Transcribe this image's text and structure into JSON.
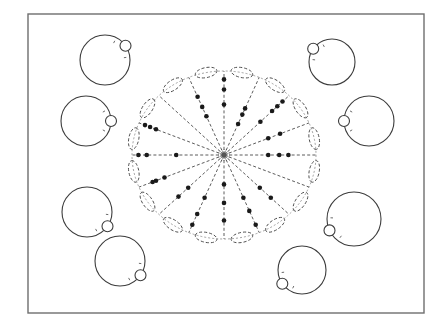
{
  "diagram": {
    "frame": {
      "x": 28,
      "y": 14,
      "width": 396,
      "height": 299
    },
    "center": {
      "x": 224,
      "y": 155
    },
    "ring": {
      "rx": 92,
      "ry": 84
    },
    "spoke_count": 16,
    "colors": {
      "line": "#3c3c3c",
      "dot": "#1a1a1a",
      "frame": "#6e6e6e",
      "background": "#ffffff"
    },
    "satellites": [
      {
        "id": "top-left-1",
        "cx": 105,
        "cy": 60,
        "r": 25,
        "knob_angle_deg": 35
      },
      {
        "id": "top-left-2",
        "cx": 86,
        "cy": 121,
        "r": 25,
        "knob_angle_deg": 0
      },
      {
        "id": "bottom-left-1",
        "cx": 87,
        "cy": 212,
        "r": 25,
        "knob_angle_deg": -35
      },
      {
        "id": "bottom-left-2",
        "cx": 120,
        "cy": 261,
        "r": 25,
        "knob_angle_deg": -35
      },
      {
        "id": "top-right-1",
        "cx": 332,
        "cy": 62,
        "r": 23,
        "knob_angle_deg": 145
      },
      {
        "id": "top-right-2",
        "cx": 369,
        "cy": 121,
        "r": 25,
        "knob_angle_deg": 180
      },
      {
        "id": "bottom-right-1",
        "cx": 354,
        "cy": 219,
        "r": 27,
        "knob_angle_deg": 205
      },
      {
        "id": "bottom-right-2",
        "cx": 302,
        "cy": 270,
        "r": 24,
        "knob_angle_deg": 215
      }
    ],
    "spoke_dots": [
      {
        "angle_deg": 0,
        "fractions": [
          0.48,
          0.6,
          0.7
        ]
      },
      {
        "angle_deg": 22.5,
        "fractions": [
          0.52,
          0.66
        ]
      },
      {
        "angle_deg": 45,
        "fractions": [
          0.56,
          0.74,
          0.82,
          0.9
        ]
      },
      {
        "angle_deg": 67.5,
        "fractions": [
          0.4,
          0.52,
          0.6
        ]
      },
      {
        "angle_deg": 90,
        "fractions": [
          0.6,
          0.78,
          0.9
        ]
      },
      {
        "angle_deg": 112.5,
        "fractions": [
          0.5,
          0.62,
          0.75
        ]
      },
      {
        "angle_deg": 135,
        "fractions": []
      },
      {
        "angle_deg": 157.5,
        "fractions": [
          0.8,
          0.87,
          0.93
        ]
      },
      {
        "angle_deg": 180,
        "fractions": [
          0.52,
          0.84,
          0.93
        ]
      },
      {
        "angle_deg": 202.5,
        "fractions": [
          0.7,
          0.8,
          0.84
        ]
      },
      {
        "angle_deg": 225,
        "fractions": [
          0.55,
          0.7
        ]
      },
      {
        "angle_deg": 247.5,
        "fractions": [
          0.55,
          0.76,
          0.9
        ]
      },
      {
        "angle_deg": 270,
        "fractions": [
          0.35,
          0.57,
          0.78
        ]
      },
      {
        "angle_deg": 292.5,
        "fractions": [
          0.55,
          0.72,
          0.9
        ]
      },
      {
        "angle_deg": 315,
        "fractions": [
          0.55,
          0.72
        ]
      },
      {
        "angle_deg": 337.5,
        "fractions": []
      }
    ],
    "petal_count": 16
  }
}
